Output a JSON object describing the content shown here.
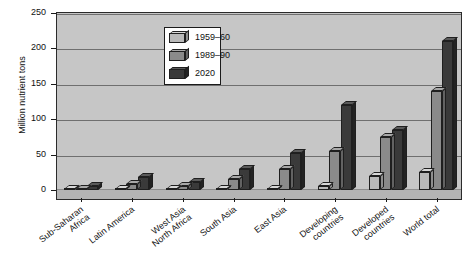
{
  "chart_data": {
    "type": "bar",
    "title": "",
    "subtitle": "",
    "xlabel": "",
    "ylabel": "Million nutrient tons",
    "ylim": [
      0,
      250
    ],
    "yticks": [
      0,
      50,
      100,
      150,
      200,
      250
    ],
    "ytick_labels": [
      "0",
      "50",
      "100",
      "150",
      "200",
      "250"
    ],
    "grid": true,
    "legend_position": "upper-left-inside",
    "style": "3d-grouped-bars",
    "categories": [
      "Sub-Saharan Africa",
      "Latin America",
      "West Asia North Africa",
      "South Asia",
      "East Asia",
      "Developing countries",
      "Developed countries",
      "World total"
    ],
    "category_lines": [
      [
        "Sub-Saharan",
        "Africa"
      ],
      [
        "Latin America"
      ],
      [
        "West Asia",
        "North Africa"
      ],
      [
        "South Asia"
      ],
      [
        "East Asia"
      ],
      [
        "Developing",
        "countries"
      ],
      [
        "Developed",
        "countries"
      ],
      [
        "World total"
      ]
    ],
    "series": [
      {
        "name": "1959–60",
        "color": "#b9b9b9",
        "values": [
          1,
          1,
          1,
          1,
          1,
          5,
          20,
          25
        ]
      },
      {
        "name": "1989–90",
        "color": "#8a8a8a",
        "values": [
          2,
          8,
          6,
          15,
          30,
          55,
          75,
          140
        ]
      },
      {
        "name": "2020",
        "color": "#3a3a3a",
        "values": [
          6,
          18,
          12,
          30,
          52,
          120,
          85,
          210
        ]
      }
    ]
  },
  "legend": {
    "items": [
      {
        "label": "1959–60"
      },
      {
        "label": "1989–90"
      },
      {
        "label": "2020"
      }
    ]
  },
  "colors": {
    "plot_background": "#c4c4c4",
    "frame": "#2b2b2b",
    "gridline": "#6f6f6f",
    "text": "#111111",
    "page_background": "#ffffff"
  }
}
